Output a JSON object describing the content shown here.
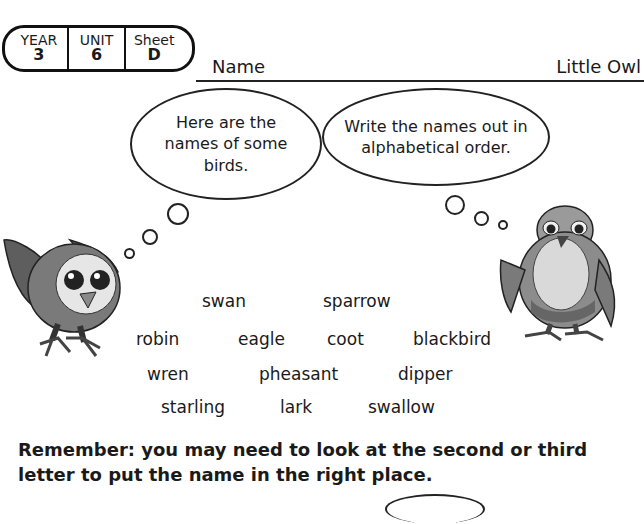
{
  "header": {
    "badge": [
      {
        "label": "YEAR",
        "value": "3"
      },
      {
        "label": "UNIT",
        "value": "6"
      },
      {
        "label": "Sheet",
        "value": "D"
      }
    ],
    "name_label": "Name",
    "worksheet_title": "Little Owl"
  },
  "bubbles": {
    "left": "Here are the names of some birds.",
    "right": "Write the names out in alphabetical order."
  },
  "birds": {
    "row1": [
      "swan",
      "sparrow"
    ],
    "row2": [
      "robin",
      "eagle",
      "coot",
      "blackbird"
    ],
    "row3": [
      "wren",
      "pheasant",
      "dipper"
    ],
    "row4": [
      "starling",
      "lark",
      "swallow"
    ]
  },
  "instruction": "Remember: you may need to look at the second or third letter to put the name in the right place.",
  "illustrations": {
    "left": "owl-illustration",
    "right": "kestrel-illustration"
  }
}
